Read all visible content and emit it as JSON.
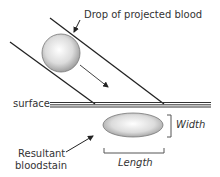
{
  "diagram": {
    "title_label": "Drop of projected blood",
    "surface_label": "surface",
    "stain_label_line1": "Resultant",
    "stain_label_line2": "bloodstain",
    "width_label": "Width",
    "length_label": "Length"
  },
  "colors": {
    "line": "#222222",
    "drop_fill_center": "#ffffff",
    "drop_fill_edge": "#9a9a9a",
    "text": "#333333"
  }
}
